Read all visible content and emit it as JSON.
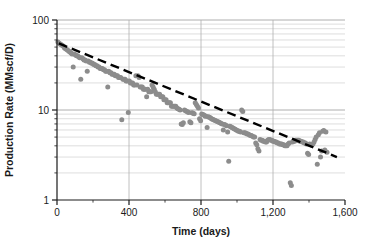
{
  "chart_data": {
    "type": "scatter",
    "title": "",
    "subtitle": "",
    "xlabel": "Time (days)",
    "ylabel": "Production Rate (MMscf/D)",
    "xlim": [
      0,
      1600
    ],
    "ylim": [
      1,
      100
    ],
    "yscale": "log",
    "xscale": "linear",
    "grid": "horizontal log minor gridlines and vertical major gridlines",
    "legend": "none",
    "x_ticks": [
      0,
      400,
      800,
      1200,
      1600
    ],
    "x_tick_labels": [
      "0",
      "400",
      "800",
      "1,200",
      "1,600"
    ],
    "x_minor_ticks": [
      200,
      600,
      1000,
      1400
    ],
    "y_ticks": [
      1,
      10,
      100
    ],
    "y_tick_labels": [
      "1",
      "10",
      "100"
    ],
    "y_minor_ticks": [
      2,
      3,
      4,
      5,
      6,
      7,
      8,
      9,
      20,
      30,
      40,
      50,
      60,
      70,
      80,
      90
    ],
    "marker": {
      "shape": "circle",
      "color": "#8c8c8c",
      "size_px": 5
    },
    "trendline": {
      "name": "Exponential decline fit",
      "style": "dashed",
      "color": "#000000",
      "width_px": 2.4,
      "x_start": 10,
      "y_start": 55,
      "x_end": 1555,
      "y_end": 3.0
    },
    "series": [
      {
        "name": "Production Rate",
        "points": [
          [
            5,
            57
          ],
          [
            12,
            55
          ],
          [
            18,
            54
          ],
          [
            24,
            53
          ],
          [
            30,
            52
          ],
          [
            36,
            51
          ],
          [
            42,
            49
          ],
          [
            48,
            48
          ],
          [
            54,
            47
          ],
          [
            60,
            46
          ],
          [
            66,
            45
          ],
          [
            72,
            44
          ],
          [
            78,
            43
          ],
          [
            84,
            42
          ],
          [
            90,
            30
          ],
          [
            96,
            42
          ],
          [
            102,
            41
          ],
          [
            108,
            40
          ],
          [
            114,
            40
          ],
          [
            120,
            39
          ],
          [
            126,
            38
          ],
          [
            132,
            22
          ],
          [
            138,
            38
          ],
          [
            144,
            37
          ],
          [
            150,
            36
          ],
          [
            156,
            36
          ],
          [
            162,
            35
          ],
          [
            168,
            27
          ],
          [
            174,
            35
          ],
          [
            180,
            34
          ],
          [
            186,
            34
          ],
          [
            192,
            33
          ],
          [
            198,
            33
          ],
          [
            204,
            32
          ],
          [
            210,
            32
          ],
          [
            216,
            31
          ],
          [
            222,
            31
          ],
          [
            228,
            30
          ],
          [
            234,
            30
          ],
          [
            240,
            29
          ],
          [
            246,
            29
          ],
          [
            252,
            29
          ],
          [
            258,
            28
          ],
          [
            264,
            28
          ],
          [
            270,
            27
          ],
          [
            276,
            27
          ],
          [
            282,
            18
          ],
          [
            288,
            27
          ],
          [
            294,
            26
          ],
          [
            300,
            26
          ],
          [
            306,
            25
          ],
          [
            312,
            25
          ],
          [
            318,
            25
          ],
          [
            324,
            24
          ],
          [
            330,
            24
          ],
          [
            336,
            24
          ],
          [
            342,
            23
          ],
          [
            348,
            23
          ],
          [
            354,
            23
          ],
          [
            360,
            7.8
          ],
          [
            366,
            22
          ],
          [
            372,
            22
          ],
          [
            378,
            22
          ],
          [
            384,
            21
          ],
          [
            390,
            21
          ],
          [
            396,
            9.4
          ],
          [
            402,
            21
          ],
          [
            408,
            20
          ],
          [
            414,
            20
          ],
          [
            420,
            20
          ],
          [
            426,
            19
          ],
          [
            432,
            19
          ],
          [
            438,
            24
          ],
          [
            444,
            19
          ],
          [
            450,
            24
          ],
          [
            456,
            23
          ],
          [
            462,
            18
          ],
          [
            468,
            18
          ],
          [
            474,
            18
          ],
          [
            480,
            17
          ],
          [
            486,
            17
          ],
          [
            492,
            17
          ],
          [
            498,
            14
          ],
          [
            504,
            17
          ],
          [
            510,
            16
          ],
          [
            516,
            16
          ],
          [
            522,
            16
          ],
          [
            528,
            19
          ],
          [
            534,
            18
          ],
          [
            540,
            17
          ],
          [
            546,
            16
          ],
          [
            552,
            15
          ],
          [
            558,
            15
          ],
          [
            564,
            15
          ],
          [
            570,
            15
          ],
          [
            576,
            14
          ],
          [
            582,
            14
          ],
          [
            588,
            14
          ],
          [
            594,
            13
          ],
          [
            600,
            13
          ],
          [
            606,
            13
          ],
          [
            612,
            12
          ],
          [
            618,
            12
          ],
          [
            624,
            12
          ],
          [
            630,
            12
          ],
          [
            636,
            11
          ],
          [
            642,
            11
          ],
          [
            648,
            11
          ],
          [
            654,
            11
          ],
          [
            660,
            11
          ],
          [
            666,
            10.5
          ],
          [
            672,
            10.3
          ],
          [
            678,
            10.2
          ],
          [
            684,
            10
          ],
          [
            690,
            7.0
          ],
          [
            696,
            6.9
          ],
          [
            702,
            7.2
          ],
          [
            708,
            10.0
          ],
          [
            714,
            9.8
          ],
          [
            720,
            9.7
          ],
          [
            726,
            9.5
          ],
          [
            732,
            9.4
          ],
          [
            738,
            7.4
          ],
          [
            744,
            7.2
          ],
          [
            750,
            9.3
          ],
          [
            756,
            9.2
          ],
          [
            762,
            9.1
          ],
          [
            768,
            12
          ],
          [
            774,
            11.5
          ],
          [
            780,
            11
          ],
          [
            786,
            10.5
          ],
          [
            792,
            8.0
          ],
          [
            798,
            7.6
          ],
          [
            804,
            9.0
          ],
          [
            810,
            8.9
          ],
          [
            816,
            8.8
          ],
          [
            822,
            8.6
          ],
          [
            828,
            8.5
          ],
          [
            834,
            6.4
          ],
          [
            840,
            8.4
          ],
          [
            846,
            8.3
          ],
          [
            852,
            8.2
          ],
          [
            858,
            8.0
          ],
          [
            864,
            7.9
          ],
          [
            870,
            7.8
          ],
          [
            876,
            7.7
          ],
          [
            882,
            7.6
          ],
          [
            888,
            7.5
          ],
          [
            894,
            7.4
          ],
          [
            900,
            7.3
          ],
          [
            906,
            7.2
          ],
          [
            912,
            7.1
          ],
          [
            918,
            7.0
          ],
          [
            924,
            6.0
          ],
          [
            930,
            6.9
          ],
          [
            936,
            6.8
          ],
          [
            942,
            6.7
          ],
          [
            948,
            5.7
          ],
          [
            954,
            2.7
          ],
          [
            960,
            6.6
          ],
          [
            966,
            6.5
          ],
          [
            972,
            6.4
          ],
          [
            978,
            6.3
          ],
          [
            984,
            6.2
          ],
          [
            990,
            6.1
          ],
          [
            996,
            6.0
          ],
          [
            1002,
            5.9
          ],
          [
            1008,
            5.8
          ],
          [
            1014,
            5.8
          ],
          [
            1020,
            5.7
          ],
          [
            1026,
            10.0
          ],
          [
            1032,
            9.6
          ],
          [
            1038,
            5.6
          ],
          [
            1044,
            5.6
          ],
          [
            1050,
            5.5
          ],
          [
            1056,
            5.4
          ],
          [
            1062,
            5.4
          ],
          [
            1068,
            5.3
          ],
          [
            1074,
            5.2
          ],
          [
            1080,
            5.2
          ],
          [
            1086,
            5.1
          ],
          [
            1092,
            5.0
          ],
          [
            1098,
            5.0
          ],
          [
            1104,
            4.3
          ],
          [
            1110,
            4.1
          ],
          [
            1116,
            3.7
          ],
          [
            1122,
            3.5
          ],
          [
            1128,
            4.7
          ],
          [
            1134,
            4.6
          ],
          [
            1140,
            4.6
          ],
          [
            1146,
            4.5
          ],
          [
            1152,
            4.5
          ],
          [
            1158,
            4.4
          ],
          [
            1164,
            4.4
          ],
          [
            1170,
            4.6
          ],
          [
            1176,
            4.7
          ],
          [
            1182,
            4.7
          ],
          [
            1188,
            4.6
          ],
          [
            1194,
            4.6
          ],
          [
            1200,
            4.5
          ],
          [
            1206,
            4.5
          ],
          [
            1212,
            4.4
          ],
          [
            1218,
            4.4
          ],
          [
            1224,
            4.3
          ],
          [
            1230,
            4.3
          ],
          [
            1236,
            4.2
          ],
          [
            1242,
            4.2
          ],
          [
            1248,
            4.2
          ],
          [
            1254,
            4.1
          ],
          [
            1260,
            4.1
          ],
          [
            1266,
            4.0
          ],
          [
            1272,
            4.0
          ],
          [
            1278,
            4.0
          ],
          [
            1284,
            4.2
          ],
          [
            1290,
            4.3
          ],
          [
            1296,
            1.55
          ],
          [
            1302,
            1.45
          ],
          [
            1308,
            4.4
          ],
          [
            1314,
            4.5
          ],
          [
            1320,
            4.5
          ],
          [
            1326,
            4.6
          ],
          [
            1332,
            4.6
          ],
          [
            1338,
            4.6
          ],
          [
            1344,
            4.6
          ],
          [
            1350,
            4.5
          ],
          [
            1356,
            4.5
          ],
          [
            1362,
            4.4
          ],
          [
            1368,
            4.4
          ],
          [
            1374,
            4.3
          ],
          [
            1380,
            4.3
          ],
          [
            1386,
            4.2
          ],
          [
            1392,
            3.3
          ],
          [
            1398,
            3.2
          ],
          [
            1404,
            4.2
          ],
          [
            1410,
            4.1
          ],
          [
            1416,
            4.1
          ],
          [
            1422,
            4.2
          ],
          [
            1428,
            4.4
          ],
          [
            1434,
            4.7
          ],
          [
            1440,
            5.0
          ],
          [
            1446,
            2.5
          ],
          [
            1452,
            5.3
          ],
          [
            1458,
            5.6
          ],
          [
            1464,
            3.0
          ],
          [
            1470,
            3.5
          ],
          [
            1476,
            5.8
          ],
          [
            1482,
            5.9
          ],
          [
            1488,
            3.6
          ],
          [
            1494,
            5.7
          ],
          [
            1500,
            3.4
          ]
        ]
      }
    ]
  },
  "colors": {
    "marker": "#8c8c8c",
    "trendline": "#000000",
    "axis": "#1a1a1a",
    "gridline": "#c8c8c8",
    "background": "#ffffff"
  }
}
